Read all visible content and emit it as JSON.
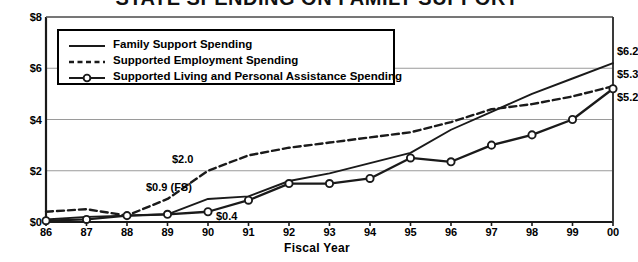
{
  "chart_data": {
    "type": "line",
    "title": "STATE SPENDING ON FAMILY SUPPORT",
    "xlabel": "Fiscal Year",
    "ylabel": "",
    "categories": [
      "86",
      "87",
      "88",
      "89",
      "90",
      "91",
      "92",
      "93",
      "94",
      "95",
      "96",
      "97",
      "98",
      "99",
      "00"
    ],
    "ylim": [
      0,
      8
    ],
    "yticks": [
      "$0",
      "$2",
      "$4",
      "$6",
      "$8"
    ],
    "ytick_values": [
      0,
      2,
      4,
      6,
      8
    ],
    "grid": "horizontal",
    "legend_position": "top-left-inside",
    "series": [
      {
        "name": "Family Support Spending",
        "style": "solid",
        "markers": false,
        "values": [
          0.1,
          0.2,
          0.25,
          0.3,
          0.9,
          1.0,
          1.6,
          1.9,
          2.3,
          2.7,
          3.6,
          4.3,
          5.0,
          5.6,
          6.2
        ]
      },
      {
        "name": "Supported Employment Spending",
        "style": "dashed",
        "markers": false,
        "values": [
          0.4,
          0.5,
          0.25,
          0.9,
          2.0,
          2.6,
          2.9,
          3.1,
          3.3,
          3.5,
          3.9,
          4.4,
          4.6,
          4.9,
          5.3
        ]
      },
      {
        "name": "Supported Living and Personal Assistance Spending",
        "style": "solid",
        "markers": true,
        "values": [
          0.05,
          0.1,
          0.25,
          0.3,
          0.4,
          0.85,
          1.5,
          1.5,
          1.7,
          2.5,
          2.35,
          3.0,
          3.4,
          4.0,
          5.2
        ]
      }
    ],
    "annotations": [
      {
        "text": "$2.0",
        "category": "90",
        "value": 2.0,
        "series": "Supported Employment Spending",
        "dx": -36,
        "dy": -12
      },
      {
        "text": "$0.9 (FS)",
        "category": "90",
        "value": 0.9,
        "series": "Family Support Spending",
        "dx": -62,
        "dy": -12
      },
      {
        "text": "$0.4",
        "category": "90",
        "value": 0.4,
        "series": "Supported Living and Personal Assistance Spending",
        "dx": 8,
        "dy": 4
      },
      {
        "text": "$6.2",
        "category": "00",
        "value": 6.2,
        "series": "Family Support Spending",
        "dx": 4,
        "dy": -12
      },
      {
        "text": "$5.3",
        "category": "00",
        "value": 5.3,
        "series": "Supported Employment Spending",
        "dx": 4,
        "dy": -12
      },
      {
        "text": "$5.2",
        "category": "00",
        "value": 5.2,
        "series": "Supported Living and Personal Assistance Spending",
        "dx": 4,
        "dy": 8
      }
    ]
  }
}
